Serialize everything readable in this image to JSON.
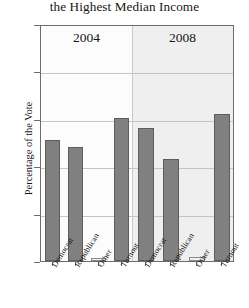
{
  "chart_data": {
    "type": "bar",
    "title": "the Highest Median Income",
    "xlabel": "",
    "ylabel": "Percentage of the Vote",
    "ylim": [
      0,
      100
    ],
    "yticks": [
      0,
      20,
      40,
      60,
      80,
      100
    ],
    "ytick_labels": [
      "0",
      "20",
      "40",
      "60",
      "80",
      "100"
    ],
    "grid": true,
    "legend": "none",
    "panels": [
      {
        "label": "2004",
        "categories": [
          "Democrat",
          "Republican",
          "Other",
          "Turnout"
        ],
        "values": [
          51,
          48,
          1,
          60.5
        ]
      },
      {
        "label": "2008",
        "categories": [
          "Democrat",
          "Republican",
          "Other",
          "Turnout"
        ],
        "values": [
          56,
          43,
          1.5,
          62
        ]
      }
    ],
    "colors": {
      "bar_fill": "#808080",
      "bar_edge": "#5d5d5d",
      "grid": "#c4c4c4",
      "axis": "#6d6d6d",
      "panel_2004_bg": "#fcfcfc",
      "panel_2008_bg": "#efefef",
      "text": "#161616"
    }
  }
}
